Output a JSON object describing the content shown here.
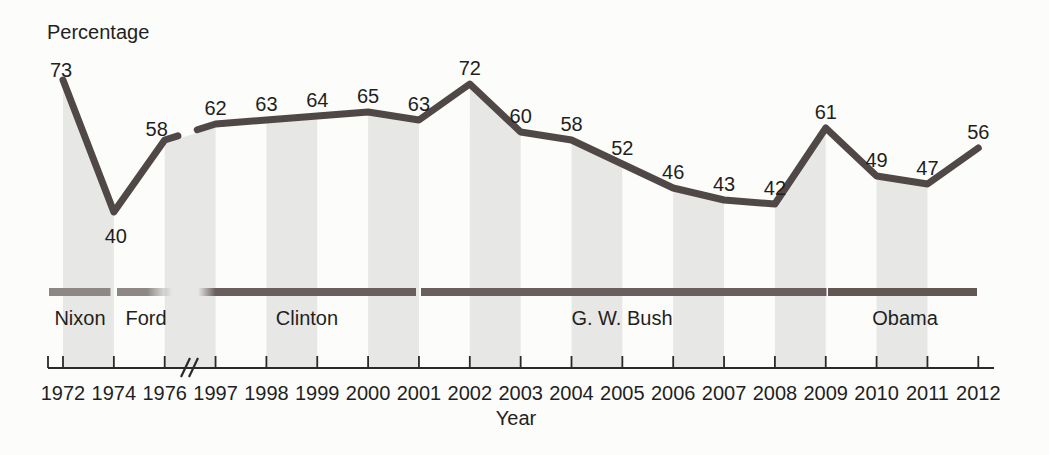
{
  "chart_data": {
    "type": "line",
    "ylabel": "Percentage",
    "xlabel": "Year",
    "x": [
      1972,
      1974,
      1976,
      1997,
      1998,
      1999,
      2000,
      2001,
      2002,
      2003,
      2004,
      2005,
      2006,
      2007,
      2008,
      2009,
      2010,
      2011,
      2012
    ],
    "values": [
      73,
      40,
      58,
      62,
      63,
      64,
      65,
      63,
      72,
      60,
      58,
      52,
      46,
      43,
      42,
      61,
      49,
      47,
      56
    ],
    "axis_break_between": [
      1976,
      1997
    ],
    "shaded_intervals": [
      [
        1972,
        1974
      ],
      [
        1976,
        1997
      ],
      [
        1998,
        1999
      ],
      [
        2000,
        2001
      ],
      [
        2002,
        2003
      ],
      [
        2004,
        2005
      ],
      [
        2006,
        2007
      ],
      [
        2008,
        2009
      ],
      [
        2010,
        2011
      ]
    ],
    "presidents": [
      {
        "name": "Nixon"
      },
      {
        "name": "Ford"
      },
      {
        "name": "Clinton"
      },
      {
        "name": "G. W. Bush"
      },
      {
        "name": "Obama"
      }
    ],
    "colors": {
      "line": "#4f4846",
      "band": "#e7e7e5",
      "bar_dark": "#6a5f5c",
      "bar_darker": "#615753",
      "bar_light": "#8d8886",
      "axis": "#2a2a2a",
      "text": "#1f1f1f",
      "background": "#fcfcfa"
    }
  }
}
